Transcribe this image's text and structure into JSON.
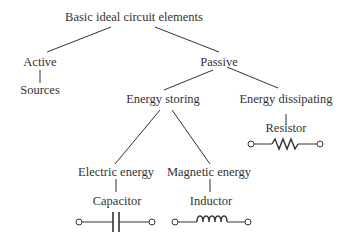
{
  "diagram": {
    "type": "tree",
    "nodes": {
      "root": "Basic ideal circuit elements",
      "active": "Active",
      "sources": "Sources",
      "passive": "Passive",
      "energy_storing": "Energy storing",
      "energy_dissipating": "Energy dissipating",
      "resistor": "Resistor",
      "electric_energy": "Electric energy",
      "magnetic_energy": "Magnetic energy",
      "capacitor": "Capacitor",
      "inductor": "Inductor"
    },
    "symbols": [
      "resistor-symbol",
      "capacitor-symbol",
      "inductor-symbol"
    ],
    "line_color": "#333333"
  }
}
